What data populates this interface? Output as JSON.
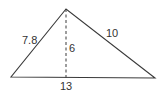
{
  "diagram": {
    "type": "triangle-with-altitude",
    "labels": {
      "left_side": "7.8",
      "right_side": "10",
      "altitude": "6",
      "base": "13"
    },
    "colors": {
      "stroke": "#3a3a3a",
      "text": "#333333",
      "background": "#ffffff"
    }
  }
}
